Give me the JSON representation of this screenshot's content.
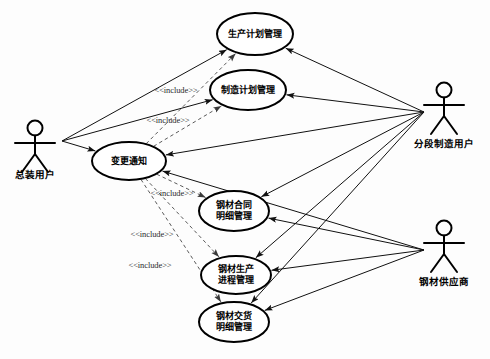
{
  "diagram": {
    "kind": "uml-use-case-diagram",
    "width": 490,
    "height": 359,
    "background_color": "#fdfdfd",
    "line_color": "#111111",
    "include_line_color": "#5a5a5a",
    "shape_fill": "#ffffff",
    "shape_stroke": "#000000"
  },
  "actors": [
    {
      "id": "actor-assembly-user",
      "name": "总装用户",
      "x": 35,
      "y": 128,
      "label_x": 35,
      "label_y": 178,
      "hub_x": 62,
      "hub_y": 141
    },
    {
      "id": "actor-block-manufacturing-user",
      "name": "分段制造用户",
      "x": 444,
      "y": 90,
      "label_x": 444,
      "label_y": 147,
      "hub_x": 424,
      "hub_y": 112
    },
    {
      "id": "actor-steel-supplier",
      "name": "钢材供应商",
      "x": 444,
      "y": 228,
      "label_x": 444,
      "label_y": 285,
      "hub_x": 424,
      "hub_y": 250
    }
  ],
  "use_cases": [
    {
      "id": "uc-production-plan",
      "lines": [
        "生产计划管理"
      ],
      "cx": 255,
      "cy": 34,
      "rx": 38,
      "ry": 21
    },
    {
      "id": "uc-manufacturing-plan",
      "lines": [
        "制造计划管理"
      ],
      "cx": 248,
      "cy": 90,
      "rx": 38,
      "ry": 20
    },
    {
      "id": "uc-change-notice",
      "lines": [
        "变更通知"
      ],
      "cx": 129,
      "cy": 161,
      "rx": 37,
      "ry": 19
    },
    {
      "id": "uc-steel-contract-detail",
      "lines": [
        "钢材合同",
        "明细管理"
      ],
      "cx": 234,
      "cy": 211,
      "rx": 35,
      "ry": 20
    },
    {
      "id": "uc-steel-production-process",
      "lines": [
        "钢材生产",
        "进程管理"
      ],
      "cx": 236,
      "cy": 275,
      "rx": 35,
      "ry": 19
    },
    {
      "id": "uc-steel-delivery-detail",
      "lines": [
        "钢材交货",
        "明细管理"
      ],
      "cx": 234,
      "cy": 322,
      "rx": 35,
      "ry": 20
    }
  ],
  "include_labels": [
    {
      "id": "include-1",
      "text": "<<include>>",
      "x": 176,
      "y": 93
    },
    {
      "id": "include-2",
      "text": "<<include>>",
      "x": 168,
      "y": 123
    },
    {
      "id": "include-3",
      "text": "<<include>>",
      "x": 172,
      "y": 196
    },
    {
      "id": "include-4",
      "text": "<<include>>",
      "x": 152,
      "y": 237
    },
    {
      "id": "include-5",
      "text": "<<include>>",
      "x": 150,
      "y": 268
    }
  ],
  "associations": [
    {
      "id": "assoc-assembly-to-production-plan",
      "from": "actor-assembly-user",
      "to": "uc-production-plan"
    },
    {
      "id": "assoc-assembly-to-manufacturing-plan",
      "from": "actor-assembly-user",
      "to": "uc-manufacturing-plan"
    },
    {
      "id": "assoc-assembly-to-change-notice",
      "from": "actor-assembly-user",
      "to": "uc-change-notice"
    },
    {
      "id": "assoc-block-to-production-plan",
      "from": "actor-block-manufacturing-user",
      "to": "uc-production-plan"
    },
    {
      "id": "assoc-block-to-manufacturing-plan",
      "from": "actor-block-manufacturing-user",
      "to": "uc-manufacturing-plan"
    },
    {
      "id": "assoc-block-to-change-notice",
      "from": "actor-block-manufacturing-user",
      "to": "uc-change-notice"
    },
    {
      "id": "assoc-block-to-steel-contract",
      "from": "actor-block-manufacturing-user",
      "to": "uc-steel-contract-detail"
    },
    {
      "id": "assoc-block-to-steel-process",
      "from": "actor-block-manufacturing-user",
      "to": "uc-steel-production-process"
    },
    {
      "id": "assoc-block-to-steel-delivery",
      "from": "actor-block-manufacturing-user",
      "to": "uc-steel-delivery-detail"
    },
    {
      "id": "assoc-supplier-to-change-notice",
      "from": "actor-steel-supplier",
      "to": "uc-change-notice"
    },
    {
      "id": "assoc-supplier-to-steel-contract",
      "from": "actor-steel-supplier",
      "to": "uc-steel-contract-detail"
    },
    {
      "id": "assoc-supplier-to-steel-process",
      "from": "actor-steel-supplier",
      "to": "uc-steel-production-process"
    },
    {
      "id": "assoc-supplier-to-steel-delivery",
      "from": "actor-steel-supplier",
      "to": "uc-steel-delivery-detail"
    }
  ],
  "include_relations": [
    {
      "id": "inc-change-to-production-plan",
      "from": "uc-change-notice",
      "to": "uc-production-plan"
    },
    {
      "id": "inc-change-to-manufacturing-plan",
      "from": "uc-change-notice",
      "to": "uc-manufacturing-plan"
    },
    {
      "id": "inc-change-to-steel-contract",
      "from": "uc-change-notice",
      "to": "uc-steel-contract-detail"
    },
    {
      "id": "inc-change-to-steel-process",
      "from": "uc-change-notice",
      "to": "uc-steel-production-process"
    },
    {
      "id": "inc-change-to-steel-delivery",
      "from": "uc-change-notice",
      "to": "uc-steel-delivery-detail"
    }
  ]
}
